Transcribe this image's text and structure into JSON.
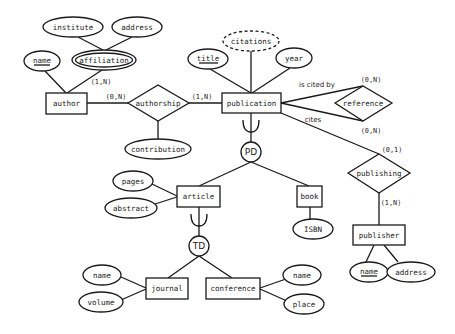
{
  "diagram": {
    "type": "entity-relationship",
    "entities": {
      "author": "author",
      "publication": "publication",
      "article": "article",
      "book": "book",
      "journal": "journal",
      "conference": "conference",
      "publisher": "publisher"
    },
    "relationships": {
      "authorship": "authorship",
      "reference": "reference",
      "publishing": "publishing"
    },
    "attributes": {
      "author_name": "name",
      "affiliation": "affiliation",
      "institute": "institute",
      "affiliation_address": "address",
      "contribution": "contribution",
      "title": "title",
      "citations": "citations",
      "year": "year",
      "pages": "pages",
      "abstract": "abstract",
      "isbn": "ISBN",
      "journal_name": "name",
      "volume": "volume",
      "conference_name": "name",
      "place": "place",
      "publisher_name": "name",
      "publisher_address": "address"
    },
    "generalizations": {
      "pd": "PD",
      "td": "TD"
    },
    "cardinalities": {
      "author_affiliation": "(1,N)",
      "author_authorship": "(0,N)",
      "publication_authorship": "(1,N)",
      "reference_cited_by": "(0,N)",
      "reference_cites": "(0,N)",
      "publication_publishing": "(0,1)",
      "publisher_publishing": "(1,N)"
    },
    "roles": {
      "is_cited_by": "is cited by",
      "cites": "cites"
    }
  }
}
